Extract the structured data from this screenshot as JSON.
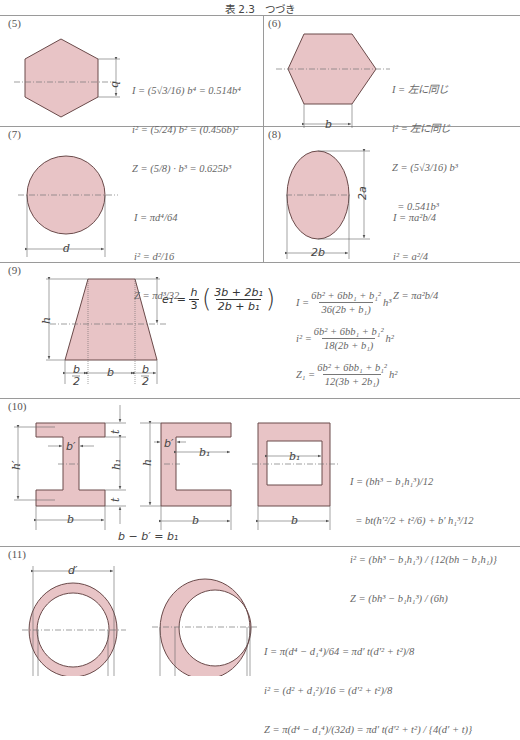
{
  "title": "表 2.3　つづき",
  "colors": {
    "fill": "#e8c4c6",
    "stroke": "#6a4a4a",
    "rule": "#9a9a9a",
    "dim": "#555555"
  },
  "cells": {
    "c5": {
      "num": "(5)",
      "dim_label": "b",
      "formulas": [
        "I = (5√3/16) b⁴ = 0.514b⁴",
        "i² = (5/24) b² = (0.456b)²",
        "Z = (5/8) · b³ = 0.625b³"
      ]
    },
    "c6": {
      "num": "(6)",
      "dim_label": "b",
      "formulas": [
        "I = 左に同じ",
        "i² = 左に同じ",
        "Z = (5√3/16) b³",
        "  = 0.541b³"
      ]
    },
    "c7": {
      "num": "(7)",
      "dim_label": "d",
      "formulas": [
        "I = πd⁴/64",
        "i² = d²/16",
        "Z = πd³/32"
      ]
    },
    "c8": {
      "num": "(8)",
      "dim_label_h": "2a",
      "dim_label_w": "2b",
      "formulas": [
        "I = πa²b/4",
        "i² = a²/4",
        "Z = πa²b/4"
      ]
    },
    "c9": {
      "num": "(9)",
      "e1_lhs": "e₁ =",
      "e1_frac_num": "h",
      "e1_frac_den": "3",
      "e1_inner_num": "3b + 2b₁",
      "e1_inner_den": "2b + b₁",
      "dim_h": "h",
      "dim_half": "b",
      "dim_half_den": "2",
      "dim_b": "b",
      "formulas": [
        {
          "lhs": "I =",
          "num": "6b² + 6bb₁ + b₁²",
          "den": "36(2b + b₁)",
          "tail": "h³"
        },
        {
          "lhs": "i² =",
          "num": "6b² + 6bb₁ + b₁²",
          "den": "18(2b + b₁)",
          "tail": "h²"
        },
        {
          "lhs": "Z₁ =",
          "num": "6b² + 6bb₁ + b₁²",
          "den": "12(3b + 2b₁)",
          "tail": "h²"
        }
      ]
    },
    "c10": {
      "num": "(10)",
      "dim_t": "t",
      "dim_h1": "h₁",
      "dim_h": "h",
      "dim_hp": "h′",
      "dim_bp": "b′",
      "dim_b1": "b₁",
      "dim_b": "b",
      "relation": "b − b′ = b₁",
      "formulas": [
        "I = (bh³ − b₁h₁³)/12",
        "  = bt(h′²/2 + t²/6) + b′ h₁³/12",
        "i² = (bh³ − b₁h₁³) / {12(bh − b₁h₁)}",
        "Z = (bh³ − b₁h₁³) / (6h)"
      ]
    },
    "c11": {
      "num": "(11)",
      "dim_dp": "d′",
      "formulas": [
        "I = π(d⁴ − d₁⁴)/64 = πd′ t(d′² + t²)/8",
        "i² = (d² + d₁²)/16 = (d′² + t²)/8",
        "Z = π(d⁴ − d₁⁴)/(32d) = πd′ t(d′² + t²) / {4(d′ + t)}"
      ]
    }
  }
}
